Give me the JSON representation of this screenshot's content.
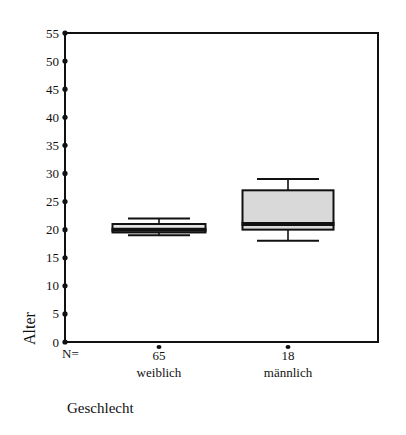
{
  "chart_data": {
    "type": "boxplot",
    "title": "",
    "xlabel": "Geschlecht",
    "ylabel": "Alter",
    "ylim": [
      0,
      55
    ],
    "yticks": [
      0,
      5,
      10,
      15,
      20,
      25,
      30,
      35,
      40,
      45,
      50,
      55
    ],
    "grid": false,
    "n_label": "N=",
    "categories": [
      "weiblich",
      "männlich"
    ],
    "n": [
      65,
      18
    ],
    "series": [
      {
        "name": "weiblich",
        "n": 65,
        "whisker_low": 19,
        "q1": 19.5,
        "median": 20,
        "q3": 21,
        "whisker_high": 22
      },
      {
        "name": "männlich",
        "n": 18,
        "whisker_low": 18,
        "q1": 20,
        "median": 21,
        "q3": 27,
        "whisker_high": 29
      }
    ]
  },
  "colors": {
    "box_fill_weiblich": "#e6e6e6",
    "box_fill_maennlich": "#d9d9d9",
    "stroke": "#111111"
  }
}
